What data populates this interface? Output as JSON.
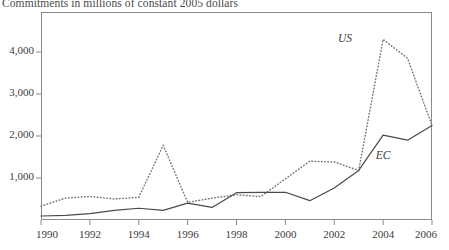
{
  "chart_data": {
    "type": "line",
    "title": "Commitments in millions of constant 2005 dollars",
    "xlabel": "",
    "ylabel": "",
    "xlim": [
      1990,
      2006
    ],
    "ylim": [
      0,
      4800
    ],
    "grid": false,
    "legend_position": "inline-annotations",
    "x": [
      1990,
      1991,
      1992,
      1993,
      1994,
      1995,
      1996,
      1997,
      1998,
      1999,
      2000,
      2001,
      2002,
      2003,
      2004,
      2005,
      2006
    ],
    "xticks": [
      "1990",
      "1992",
      "1994",
      "1996",
      "1998",
      "2000",
      "2002",
      "2004",
      "2006"
    ],
    "yticks": [
      "1,000",
      "2,000",
      "3,000",
      "4,000"
    ],
    "series": [
      {
        "name": "US",
        "style": "dotted",
        "color": "#7a7a7a",
        "values": [
          330,
          520,
          560,
          500,
          540,
          1780,
          420,
          520,
          600,
          560,
          980,
          1400,
          1380,
          1180,
          4300,
          3850,
          2250
        ]
      },
      {
        "name": "EC",
        "style": "solid",
        "color": "#4a4a4a",
        "values": [
          95,
          110,
          150,
          230,
          280,
          230,
          400,
          300,
          650,
          660,
          660,
          460,
          760,
          1180,
          2020,
          1900,
          2250
        ]
      }
    ],
    "annotations": [
      {
        "text": "US",
        "x": 2003.05,
        "y": 4280
      },
      {
        "text": "EC",
        "x": 2004.6,
        "y": 1500
      }
    ]
  }
}
